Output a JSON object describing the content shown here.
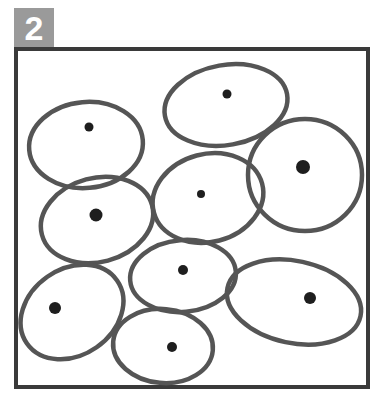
{
  "panel": {
    "label": "2",
    "colors": {
      "badge_bg": "#9a9a9a",
      "badge_text": "#ffffff",
      "frame": "#3a3a3a",
      "cell_outline": "#555555",
      "nucleus": "#1e1e1e"
    }
  },
  "cells": [
    {
      "id": "cell-1",
      "cx": 86,
      "cy": 145,
      "rx": 57,
      "ry": 43,
      "rot": -5,
      "nucleus": {
        "x": 89,
        "y": 127,
        "r": 4.5
      }
    },
    {
      "id": "cell-2",
      "cx": 226,
      "cy": 105,
      "rx": 62,
      "ry": 40,
      "rot": -10,
      "nucleus": {
        "x": 227,
        "y": 94,
        "r": 4.5
      }
    },
    {
      "id": "cell-3",
      "cx": 305,
      "cy": 175,
      "rx": 57,
      "ry": 56,
      "rot": 0,
      "nucleus": {
        "x": 303,
        "y": 167,
        "r": 7
      }
    },
    {
      "id": "cell-4",
      "cx": 97,
      "cy": 220,
      "rx": 57,
      "ry": 42,
      "rot": -15,
      "nucleus": {
        "x": 96,
        "y": 215,
        "r": 6.5
      }
    },
    {
      "id": "cell-5",
      "cx": 208,
      "cy": 198,
      "rx": 56,
      "ry": 44,
      "rot": -15,
      "nucleus": {
        "x": 201,
        "y": 194,
        "r": 4
      }
    },
    {
      "id": "cell-6",
      "cx": 183,
      "cy": 276,
      "rx": 53,
      "ry": 36,
      "rot": -5,
      "nucleus": {
        "x": 183,
        "y": 270,
        "r": 5
      }
    },
    {
      "id": "cell-7",
      "cx": 72,
      "cy": 312,
      "rx": 55,
      "ry": 43,
      "rot": -35,
      "nucleus": {
        "x": 55,
        "y": 308,
        "r": 6
      }
    },
    {
      "id": "cell-8",
      "cx": 163,
      "cy": 346,
      "rx": 50,
      "ry": 37,
      "rot": 5,
      "nucleus": {
        "x": 172,
        "y": 347,
        "r": 5
      }
    },
    {
      "id": "cell-9",
      "cx": 294,
      "cy": 302,
      "rx": 68,
      "ry": 41,
      "rot": 12,
      "nucleus": {
        "x": 310,
        "y": 298,
        "r": 6
      }
    }
  ]
}
